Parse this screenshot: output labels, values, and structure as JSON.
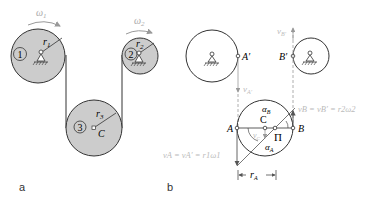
{
  "panels": {
    "a": {
      "label": "a",
      "omega1": "ω",
      "omega1_sub": "1",
      "omega2": "ω",
      "omega2_sub": "2",
      "pulley1": {
        "number": "1",
        "radius_label": "r",
        "radius_sub": "1"
      },
      "pulley2": {
        "number": "2",
        "radius_label": "r",
        "radius_sub": "2"
      },
      "pulley3": {
        "number": "3",
        "radius_label": "r",
        "radius_sub": "3",
        "center_label": "C"
      }
    },
    "b": {
      "label": "b",
      "A_prime": "A′",
      "B_prime": "B′",
      "vA_prime": "v",
      "vA_prime_sub": "A′",
      "vB_prime": "v",
      "vB_prime_sub": "B′",
      "A": "A",
      "B": "B",
      "C": "C",
      "Pi": "Π",
      "alpha_B": "α",
      "alpha_B_sub": "B",
      "alpha_A": "α",
      "alpha_A_sub": "A",
      "vC": "v",
      "vC_sub": "C",
      "eq_A": "v",
      "eq_A_rest": "A = vA′ = r1ω1",
      "eq_B_rest": "B = vB′ = r2ω2",
      "rA": "r",
      "rA_sub": "A"
    }
  },
  "colors": {
    "fill": "#cccccc",
    "stroke": "#333333",
    "faint": "#bbbbbb"
  }
}
